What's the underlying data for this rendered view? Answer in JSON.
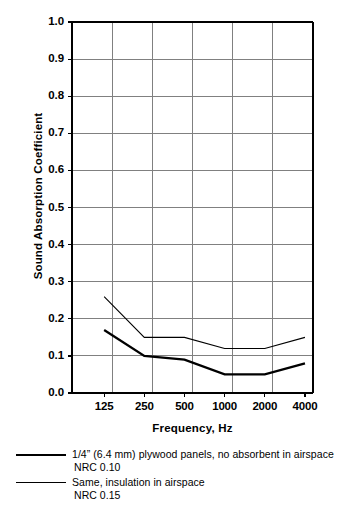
{
  "chart_data": {
    "type": "line",
    "title": "",
    "xlabel": "Frequency, Hz",
    "ylabel": "Sound Absorption Coefficient",
    "categories": [
      "125",
      "250",
      "500",
      "1000",
      "2000",
      "4000"
    ],
    "x_tick_labels": [
      "125",
      "250",
      "500",
      "1000",
      "2000",
      "4000"
    ],
    "y_tick_labels": [
      "1.0",
      "0.9",
      "0.8",
      "0.7",
      "0.6",
      "0.5",
      "0.4",
      "0.3",
      "0.2",
      "0.1",
      "0.0"
    ],
    "y_tick_values": [
      1.0,
      0.9,
      0.8,
      0.7,
      0.6,
      0.5,
      0.4,
      0.3,
      0.2,
      0.1,
      0.0
    ],
    "ylim": [
      0.0,
      1.0
    ],
    "grid": true,
    "grid_color": "#808080",
    "axis_color": "#000000",
    "legend_position": "below",
    "series": [
      {
        "name": "1/4\" (6.4 mm) plywood panels, no absorbent in airspace",
        "nrc_label": "NRC 0.10",
        "nrc": 0.1,
        "style": "thick",
        "color": "#000000",
        "values": [
          0.17,
          0.1,
          0.09,
          0.05,
          0.05,
          0.08
        ]
      },
      {
        "name": "Same, insulation in airspace",
        "nrc_label": "NRC 0.15",
        "nrc": 0.15,
        "style": "thin",
        "color": "#000000",
        "values": [
          0.26,
          0.15,
          0.15,
          0.12,
          0.12,
          0.15
        ]
      }
    ]
  },
  "legend": {
    "entries": [
      {
        "label": "1/4” (6.4 mm) plywood panels, no absorbent in airspace",
        "sub": "NRC 0.10",
        "style": "thick"
      },
      {
        "label": "Same, insulation in airspace",
        "sub": "NRC 0.15",
        "style": "thin"
      }
    ]
  }
}
